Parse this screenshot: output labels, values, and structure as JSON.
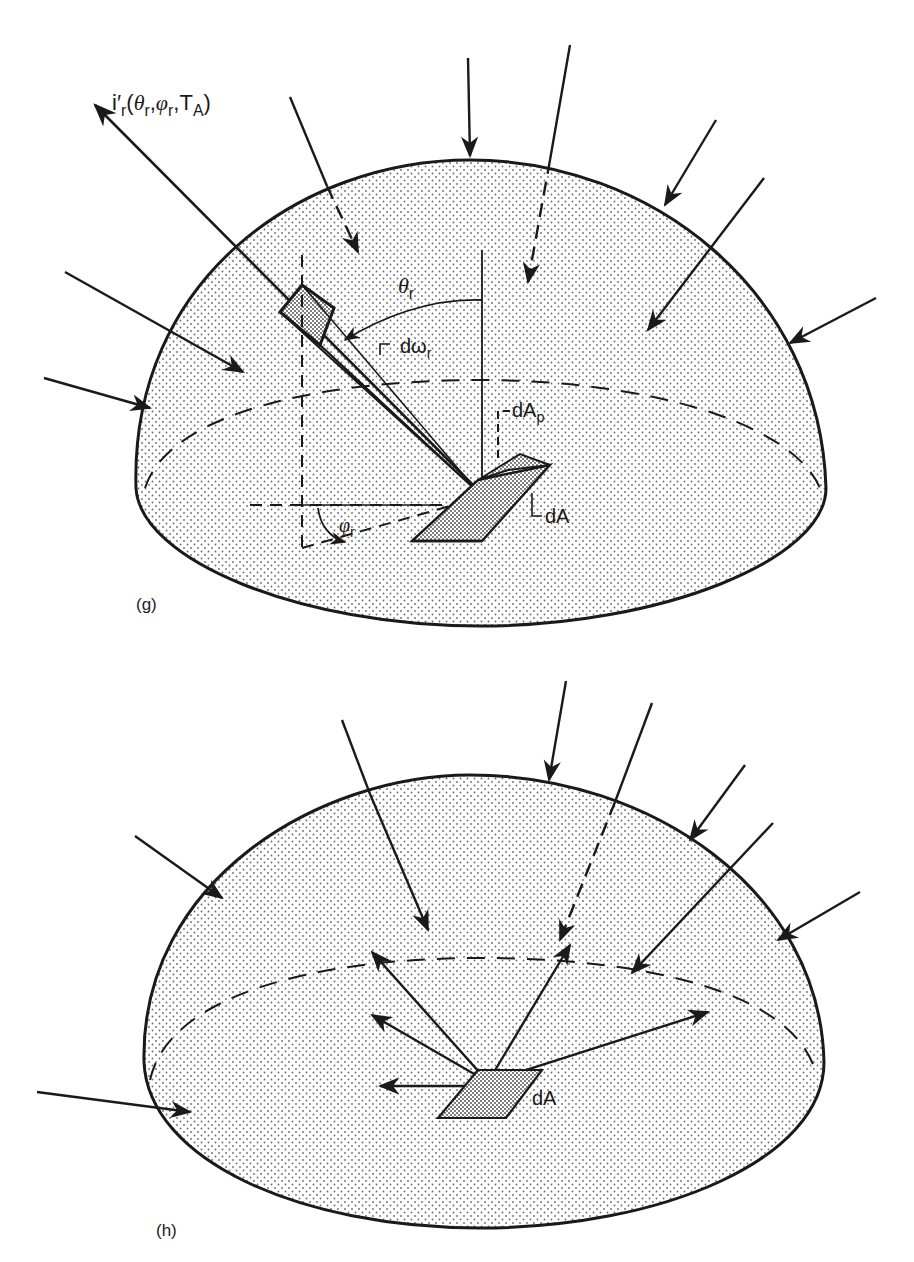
{
  "figure_g": {
    "panel_label": "(g)",
    "intensity_label": {
      "main": "i",
      "prime": "′",
      "sub": "r",
      "args_open": "(",
      "theta": "θ",
      "theta_sub": "r",
      "sep1": ",",
      "phi": "φ",
      "phi_sub": "r",
      "sep2": ",",
      "T": "T",
      "T_sub": "A",
      "args_close": ")"
    },
    "theta_label": {
      "symbol": "θ",
      "sub": "r"
    },
    "solid_angle_label": {
      "symbol": "dω",
      "sub": "r"
    },
    "projected_area_label": {
      "symbol": "dA",
      "sub": "p"
    },
    "area_label": "dA",
    "phi_label": {
      "symbol": "φ",
      "sub": "r"
    },
    "description": "Hemisphere with incident radiation from all directions; reflected intensity into solid angle dω_r from surface element dA"
  },
  "figure_h": {
    "panel_label": "(h)",
    "area_label": "dA",
    "description": "Hemisphere with diffuse incident radiation from all directions and reflection into all directions from dA"
  },
  "colors": {
    "ink": "#1a1a1a",
    "stipple": "#6a6a6a",
    "background": "#ffffff"
  }
}
